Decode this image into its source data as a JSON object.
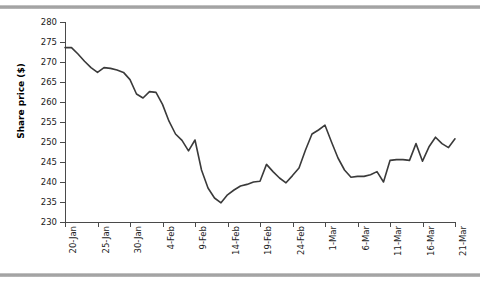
{
  "page": {
    "background_color": "#ffffff",
    "decor": {
      "top_bar_name": "scan-edge-bar-top",
      "bottom_bar_name": "scan-edge-bar-bottom",
      "bar_color": "#9a9a9a"
    }
  },
  "chart_data": {
    "type": "line",
    "title": "",
    "subtitle": "",
    "xlabel": "",
    "ylabel": "Share price ($)",
    "ylim": [
      230,
      280
    ],
    "xlim": [
      "20-Jan",
      "21-Mar"
    ],
    "grid": false,
    "legend": "none",
    "line_color": "#3a3a3a",
    "line_width": 1.6,
    "ytick_labels": [
      "230",
      "235",
      "240",
      "245",
      "250",
      "255",
      "260",
      "265",
      "270",
      "275",
      "280"
    ],
    "ytick_values": [
      230,
      235,
      240,
      245,
      250,
      255,
      260,
      265,
      270,
      275,
      280
    ],
    "xtick_labels": [
      "20-Jan",
      "25-Jan",
      "30-Jan",
      "4-Feb",
      "9-Feb",
      "14-Feb",
      "19-Feb",
      "24-Feb",
      "1-Mar",
      "6-Mar",
      "11-Mar",
      "16-Mar",
      "21-Mar"
    ],
    "xtick_indices": [
      0,
      5,
      10,
      15,
      20,
      25,
      30,
      35,
      40,
      45,
      50,
      55,
      60
    ],
    "x": [
      "20-Jan",
      "21-Jan",
      "22-Jan",
      "23-Jan",
      "24-Jan",
      "25-Jan",
      "26-Jan",
      "27-Jan",
      "28-Jan",
      "29-Jan",
      "30-Jan",
      "31-Jan",
      "1-Feb",
      "2-Feb",
      "3-Feb",
      "4-Feb",
      "5-Feb",
      "6-Feb",
      "7-Feb",
      "8-Feb",
      "9-Feb",
      "10-Feb",
      "11-Feb",
      "12-Feb",
      "13-Feb",
      "14-Feb",
      "15-Feb",
      "16-Feb",
      "17-Feb",
      "18-Feb",
      "19-Feb",
      "20-Feb",
      "21-Feb",
      "22-Feb",
      "23-Feb",
      "24-Feb",
      "25-Feb",
      "26-Feb",
      "27-Feb",
      "28-Feb",
      "1-Mar",
      "2-Mar",
      "3-Mar",
      "4-Mar",
      "5-Mar",
      "6-Mar",
      "7-Mar",
      "8-Mar",
      "9-Mar",
      "10-Mar",
      "11-Mar",
      "12-Mar",
      "13-Mar",
      "14-Mar",
      "15-Mar",
      "16-Mar",
      "17-Mar",
      "18-Mar",
      "19-Mar",
      "20-Mar",
      "21-Mar"
    ],
    "values": [
      273.6,
      273.6,
      272.0,
      270.2,
      268.6,
      267.4,
      268.6,
      268.4,
      268.0,
      267.4,
      265.6,
      262.0,
      261.0,
      262.6,
      262.4,
      259.4,
      255.2,
      252.0,
      250.4,
      247.8,
      250.5,
      243.0,
      238.5,
      236.0,
      234.8,
      236.8,
      238.0,
      239.0,
      239.4,
      240.0,
      240.2,
      244.4,
      242.6,
      241.0,
      239.8,
      241.6,
      243.5,
      248.0,
      252.0,
      253.0,
      254.2,
      250.0,
      246.0,
      243.0,
      241.2,
      241.4,
      241.4,
      241.8,
      242.6,
      240.0,
      245.4,
      245.6,
      245.6,
      245.4,
      249.6,
      245.2,
      248.8,
      251.2,
      249.6,
      248.6,
      250.8
    ],
    "series_name": "Share price"
  }
}
